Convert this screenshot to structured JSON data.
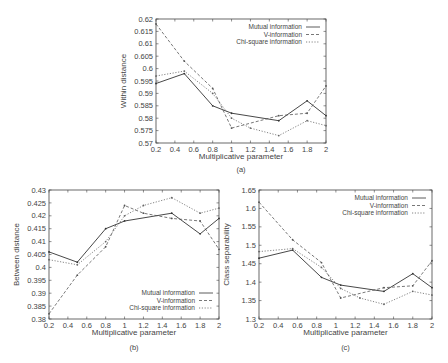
{
  "chart_data": [
    {
      "id": "a",
      "type": "line",
      "caption": "(a)",
      "title": "",
      "xlabel": "Multiplicative parameter",
      "ylabel": "Within distance",
      "xlim": [
        0.2,
        2
      ],
      "ylim": [
        0.57,
        0.62
      ],
      "xticks": [
        0.2,
        0.4,
        0.6,
        0.8,
        1,
        1.2,
        1.4,
        1.6,
        1.8,
        2
      ],
      "yticks": [
        0.57,
        0.575,
        0.58,
        0.585,
        0.59,
        0.595,
        0.6,
        0.605,
        0.61,
        0.615,
        0.62
      ],
      "ytick_labels": [
        "0.57",
        "0.575",
        "0.58",
        "0.585",
        "0.59",
        "0.595",
        "0.6",
        "0.605",
        "0.61",
        "0.615",
        "0.62"
      ],
      "grid": false,
      "legend_position": "top-right",
      "series": [
        {
          "name": "Mutual information",
          "style": "solid",
          "x": [
            0.2,
            0.5,
            0.8,
            1.0,
            1.5,
            1.8,
            2.0
          ],
          "values": [
            0.594,
            0.598,
            0.585,
            0.582,
            0.579,
            0.587,
            0.581
          ]
        },
        {
          "name": "V-information",
          "style": "dashed",
          "x": [
            0.2,
            0.5,
            0.8,
            1.0,
            1.5,
            1.8,
            2.0
          ],
          "values": [
            0.618,
            0.603,
            0.592,
            0.576,
            0.581,
            0.582,
            0.593
          ]
        },
        {
          "name": "Chi-square information",
          "style": "dotdash",
          "x": [
            0.2,
            0.5,
            0.8,
            1.0,
            1.2,
            1.5,
            1.8,
            2.0
          ],
          "values": [
            0.597,
            0.599,
            0.59,
            0.58,
            0.576,
            0.573,
            0.579,
            0.577
          ]
        }
      ]
    },
    {
      "id": "b",
      "type": "line",
      "caption": "(b)",
      "title": "",
      "xlabel": "Multiplicative parameter",
      "ylabel": "Between distance",
      "xlim": [
        0.2,
        2
      ],
      "ylim": [
        0.38,
        0.43
      ],
      "xticks": [
        0.2,
        0.4,
        0.6,
        0.8,
        1,
        1.2,
        1.4,
        1.6,
        1.8,
        2
      ],
      "yticks": [
        0.38,
        0.385,
        0.39,
        0.395,
        0.4,
        0.405,
        0.41,
        0.415,
        0.42,
        0.425,
        0.43
      ],
      "ytick_labels": [
        "0.38",
        "0.385",
        "0.39",
        "0.395",
        "0.4",
        "0.405",
        "0.41",
        "0.415",
        "0.42",
        "0.425",
        "0.43"
      ],
      "grid": false,
      "legend_position": "bottom-right",
      "series": [
        {
          "name": "Mutual information",
          "style": "solid",
          "x": [
            0.2,
            0.5,
            0.8,
            1.0,
            1.5,
            1.8,
            2.0
          ],
          "values": [
            0.406,
            0.402,
            0.415,
            0.418,
            0.421,
            0.413,
            0.419
          ]
        },
        {
          "name": "V-information",
          "style": "dashed",
          "x": [
            0.2,
            0.5,
            0.8,
            1.0,
            1.2,
            1.5,
            1.8,
            2.0
          ],
          "values": [
            0.382,
            0.397,
            0.408,
            0.424,
            0.421,
            0.419,
            0.418,
            0.407
          ]
        },
        {
          "name": "Chi-square information",
          "style": "dotdash",
          "x": [
            0.2,
            0.5,
            0.8,
            1.0,
            1.2,
            1.5,
            1.8,
            2.0
          ],
          "values": [
            0.403,
            0.401,
            0.41,
            0.42,
            0.424,
            0.427,
            0.421,
            0.423
          ]
        }
      ]
    },
    {
      "id": "c",
      "type": "line",
      "caption": "(c)",
      "title": "",
      "xlabel": "Multiplicative parameter",
      "ylabel": "Class separability",
      "xlim": [
        0.2,
        2
      ],
      "ylim": [
        1.3,
        1.65
      ],
      "xticks": [
        0.2,
        0.4,
        0.6,
        0.8,
        1,
        1.2,
        1.4,
        1.6,
        1.8,
        2
      ],
      "yticks": [
        1.3,
        1.35,
        1.4,
        1.45,
        1.5,
        1.55,
        1.6,
        1.65
      ],
      "ytick_labels": [
        "1.3",
        "1.35",
        "1.4",
        "1.45",
        "1.5",
        "1.55",
        "1.6",
        "1.65"
      ],
      "grid": false,
      "legend_position": "top-right",
      "series": [
        {
          "name": "Mutual information",
          "style": "solid",
          "x": [
            0.2,
            0.55,
            0.85,
            1.05,
            1.5,
            1.8,
            2.0
          ],
          "values": [
            1.465,
            1.487,
            1.413,
            1.392,
            1.375,
            1.423,
            1.385
          ]
        },
        {
          "name": "V-information",
          "style": "dashed",
          "x": [
            0.2,
            0.55,
            0.85,
            1.05,
            1.5,
            1.8,
            2.0
          ],
          "values": [
            1.617,
            1.515,
            1.453,
            1.357,
            1.385,
            1.39,
            1.458
          ]
        },
        {
          "name": "Chi-square information",
          "style": "dotdash",
          "x": [
            0.2,
            0.55,
            0.85,
            1.05,
            1.25,
            1.5,
            1.8,
            2.0
          ],
          "values": [
            1.483,
            1.491,
            1.44,
            1.383,
            1.357,
            1.34,
            1.375,
            1.365
          ]
        }
      ]
    }
  ],
  "layout": {
    "plots": [
      {
        "left": 156,
        "top": 19,
        "right": 326,
        "bottom": 143,
        "xlabel_y": 159,
        "caption_y": 172
      },
      {
        "left": 49,
        "top": 190,
        "right": 219,
        "bottom": 319,
        "xlabel_y": 335,
        "caption_y": 350
      },
      {
        "left": 259,
        "top": 190,
        "right": 432,
        "bottom": 319,
        "xlabel_y": 335,
        "caption_y": 350
      }
    ]
  },
  "legend_labels": [
    "Mutual information",
    "V-information",
    "Chi-square information"
  ]
}
